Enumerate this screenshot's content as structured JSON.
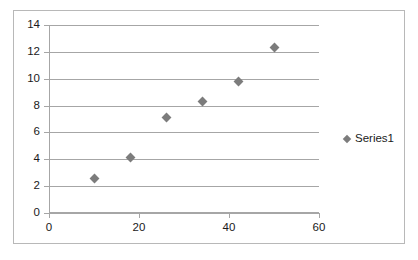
{
  "chart_data": {
    "type": "scatter",
    "title": "",
    "xlabel": "",
    "ylabel": "",
    "xlim": [
      0,
      60
    ],
    "ylim": [
      0,
      14
    ],
    "x_ticks": [
      0,
      20,
      40,
      60
    ],
    "y_ticks": [
      0,
      2,
      4,
      6,
      8,
      10,
      12,
      14
    ],
    "grid": "horizontal",
    "legend_position": "right",
    "marker": "diamond",
    "marker_color": "#7c7c7c",
    "gridline_color": "#a6a6a6",
    "border_color": "#b8b8b8",
    "series": [
      {
        "name": "Series1",
        "points": [
          {
            "x": 10,
            "y": 2.6
          },
          {
            "x": 18,
            "y": 4.1
          },
          {
            "x": 26,
            "y": 7.1
          },
          {
            "x": 34,
            "y": 8.3
          },
          {
            "x": 42,
            "y": 9.8
          },
          {
            "x": 50,
            "y": 12.3
          }
        ]
      }
    ]
  },
  "legend": {
    "entries": [
      {
        "label": "Series1"
      }
    ]
  },
  "axis": {
    "y_labels": [
      "14",
      "12",
      "10",
      "8",
      "6",
      "4",
      "2",
      "0"
    ],
    "x_labels": [
      "0",
      "20",
      "40",
      "60"
    ]
  }
}
